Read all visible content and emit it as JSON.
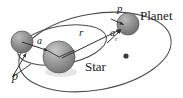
{
  "figure": {
    "background_color": "#ffffff",
    "stroke_color": "#3b3b3b",
    "labels": {
      "planet": "Planet",
      "star": "Star",
      "perihelion_top": "p",
      "perihelion_left": "p",
      "semi_major_star": "a",
      "radius": "r",
      "semi_major_planet_base": "a",
      "semi_major_planet_sub": "r"
    },
    "bodies": [
      {
        "name": "star",
        "label": "Star",
        "cx": 59,
        "cy": 57,
        "r": 16,
        "fill": "#8f8f8f"
      },
      {
        "name": "companion",
        "label": "",
        "cx": 22,
        "cy": 42,
        "r": 11,
        "fill": "#8a8a8a"
      },
      {
        "name": "planet",
        "label": "Planet",
        "cx": 128,
        "cy": 24,
        "r": 11,
        "fill": "#8a8a8a"
      },
      {
        "name": "empty-focus",
        "label": "",
        "cx": 126,
        "cy": 56,
        "r": 2.6,
        "fill": "#3a3a3a"
      }
    ],
    "orbits": [
      {
        "name": "planet-orbit",
        "cx": 95,
        "cy": 52,
        "rx": 77,
        "ry": 38,
        "rotation": -10
      },
      {
        "name": "star-orbit",
        "cx": 62,
        "cy": 45,
        "rx": 45,
        "ry": 19,
        "rotation": -10
      }
    ],
    "vectors": [
      {
        "name": "a-vector-star",
        "from": [
          22,
          42
        ],
        "to": [
          48,
          51
        ]
      },
      {
        "name": "r-vector",
        "from": [
          62,
          58
        ],
        "to": [
          120,
          30
        ]
      },
      {
        "name": "ar-vector",
        "from": [
          108,
          42
        ],
        "to": [
          121,
          30
        ]
      },
      {
        "name": "p-vector-planet",
        "from": [
          112,
          20
        ],
        "to": [
          124,
          25
        ]
      },
      {
        "name": "p-vector-left",
        "from": [
          13,
          76
        ],
        "to": [
          28,
          54
        ]
      },
      {
        "name": "star-tick-left",
        "from": [
          59,
          57
        ],
        "to": [
          47,
          50
        ]
      },
      {
        "name": "star-tick-right",
        "from": [
          59,
          57
        ],
        "to": [
          74,
          50
        ]
      }
    ]
  }
}
